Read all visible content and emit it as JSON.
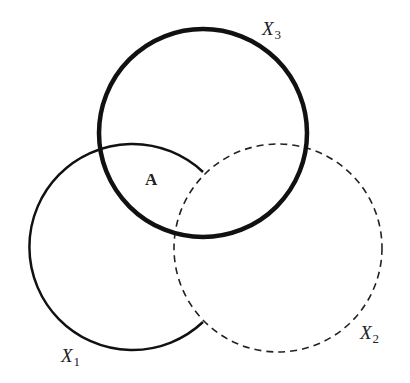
{
  "diagram": {
    "type": "venn",
    "sets": [
      {
        "id": "X1",
        "label_main": "X",
        "label_sub": "1",
        "style": "solid",
        "stroke_width": 2.5,
        "center": [
          129,
          247
        ],
        "radius": 103
      },
      {
        "id": "X2",
        "label_main": "X",
        "label_sub": "2",
        "style": "dashed",
        "stroke_width": 1.6,
        "center": [
          278,
          248
        ],
        "radius": 104
      },
      {
        "id": "X3",
        "label_main": "X",
        "label_sub": "3",
        "style": "solid-thick",
        "stroke_width": 4.5,
        "center": [
          203,
          133
        ],
        "radius": 104
      }
    ],
    "regions": [
      {
        "label": "A",
        "description": "intersection of X1 and X3 outside X2"
      }
    ],
    "stroke_color": "#111111"
  }
}
